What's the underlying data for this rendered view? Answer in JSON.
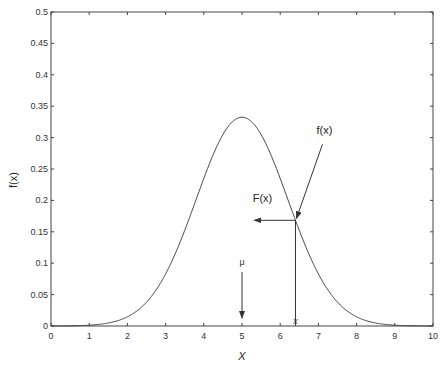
{
  "chart_data": {
    "type": "line",
    "title": "",
    "xlabel": "X",
    "ylabel": "f(x)",
    "xlim": [
      0,
      10
    ],
    "ylim": [
      0,
      0.5
    ],
    "xticks": [
      "0",
      "1",
      "2",
      "3",
      "4",
      "5",
      "6",
      "7",
      "8",
      "9",
      "10"
    ],
    "yticks": [
      "0",
      "0.05",
      "0.1",
      "0.15",
      "0.2",
      "0.25",
      "0.3",
      "0.35",
      "0.4",
      "0.45",
      "0.5"
    ],
    "grid": false,
    "series": [
      {
        "name": "normal pdf",
        "distribution": "normal",
        "mu": 5,
        "sigma": 1.2,
        "peak": 0.33
      }
    ],
    "annotations": {
      "mu_label": "μ",
      "mu_x": 5,
      "x_marker_label": "x",
      "x_marker": 6.4,
      "fx_label": "f(x)",
      "Fx_label": "F(x)"
    }
  }
}
